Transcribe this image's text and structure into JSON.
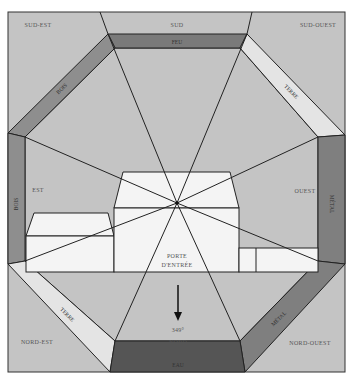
{
  "diagram": {
    "type": "bagua-floorplan",
    "compass_directions": {
      "south_east": "SUD-EST",
      "south": "SUD",
      "south_west": "SUD-OUEST",
      "east": "EST",
      "west": "OUEST",
      "north_east": "NORD-EST",
      "north": "NORD",
      "north_west": "NORD-OUEST"
    },
    "elements": {
      "top": "FEU",
      "top_left": "BOIS",
      "left": "BOIS",
      "top_right": "TERRE",
      "right": "MÉTAL",
      "bottom_left": "TERRE",
      "bottom_right": "MÉTAL",
      "bottom": "EAU"
    },
    "house": {
      "door_label_line1": "PORTE",
      "door_label_line2": "D'ENTRÉE"
    },
    "bearing": "349°",
    "colors": {
      "background": "#c4c4c4",
      "frame_line": "#333333",
      "band_feu": "#7a7a7a",
      "band_eau": "#555555",
      "band_bois": "#8e8e8e",
      "band_terre": "#e4e4e4",
      "band_metal": "#7f7f7f",
      "house_fill": "#f4f4f4",
      "text": "#555555"
    }
  }
}
